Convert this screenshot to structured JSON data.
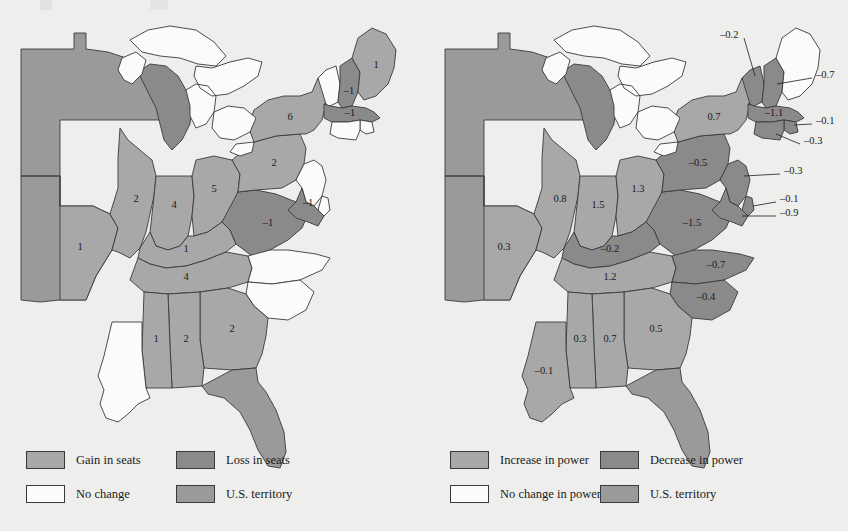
{
  "figure": {
    "background_color": "#eeeeec",
    "panels": [
      {
        "id": "seats",
        "legend": {
          "items": [
            {
              "key": "gain",
              "label": "Gain in seats",
              "color": "#a8a8a8"
            },
            {
              "key": "loss",
              "label": "Loss in seats",
              "color": "#8a8a8a"
            },
            {
              "key": "nochange",
              "label": "No change",
              "color": "#fcfcfb"
            },
            {
              "key": "territory",
              "label": "U.S. territory",
              "color": "#9a9a9a"
            }
          ]
        }
      },
      {
        "id": "power",
        "legend": {
          "items": [
            {
              "key": "gain",
              "label": "Increase in power",
              "color": "#a8a8a8"
            },
            {
              "key": "loss",
              "label": "Decrease in power",
              "color": "#8a8a8a"
            },
            {
              "key": "nochange",
              "label": "No change in power",
              "color": "#fcfcfb"
            },
            {
              "key": "territory",
              "label": "U.S. territory",
              "color": "#9a9a9a"
            }
          ]
        }
      }
    ]
  },
  "chart_data": {
    "type": "map",
    "title": "",
    "maps": [
      {
        "name": "Gain/Loss in seats",
        "value_type": "seats",
        "legend_position": "bottom-left",
        "states": [
          {
            "state": "Maine",
            "abbr": "ME",
            "value": 1,
            "label": "1",
            "category": "gain"
          },
          {
            "state": "Vermont",
            "abbr": "VT",
            "value": 0,
            "label": "",
            "category": "nochange"
          },
          {
            "state": "New Hampshire",
            "abbr": "NH",
            "value": -1,
            "label": "-1",
            "category": "loss"
          },
          {
            "state": "Massachusetts",
            "abbr": "MA",
            "value": -1,
            "label": "-1",
            "category": "loss"
          },
          {
            "state": "Rhode Island",
            "abbr": "RI",
            "value": 0,
            "label": "",
            "category": "nochange"
          },
          {
            "state": "Connecticut",
            "abbr": "CT",
            "value": 0,
            "label": "",
            "category": "nochange"
          },
          {
            "state": "New York",
            "abbr": "NY",
            "value": 6,
            "label": "6",
            "category": "gain"
          },
          {
            "state": "New Jersey",
            "abbr": "NJ",
            "value": 0,
            "label": "",
            "category": "nochange"
          },
          {
            "state": "Pennsylvania",
            "abbr": "PA",
            "value": 2,
            "label": "2",
            "category": "gain"
          },
          {
            "state": "Delaware",
            "abbr": "DE",
            "value": 0,
            "label": "",
            "category": "nochange"
          },
          {
            "state": "Maryland",
            "abbr": "MD",
            "value": -1,
            "label": "-1",
            "category": "loss"
          },
          {
            "state": "Virginia",
            "abbr": "VA",
            "value": -1,
            "label": "-1",
            "category": "loss"
          },
          {
            "state": "North Carolina",
            "abbr": "NC",
            "value": 0,
            "label": "",
            "category": "nochange"
          },
          {
            "state": "South Carolina",
            "abbr": "SC",
            "value": 0,
            "label": "",
            "category": "nochange"
          },
          {
            "state": "Georgia",
            "abbr": "GA",
            "value": 2,
            "label": "2",
            "category": "gain"
          },
          {
            "state": "Florida",
            "abbr": "FL",
            "value": null,
            "label": "",
            "category": "territory"
          },
          {
            "state": "Alabama",
            "abbr": "AL",
            "value": 2,
            "label": "2",
            "category": "gain"
          },
          {
            "state": "Mississippi",
            "abbr": "MS",
            "value": 1,
            "label": "1",
            "category": "gain"
          },
          {
            "state": "Louisiana",
            "abbr": "LA",
            "value": 0,
            "label": "",
            "category": "nochange"
          },
          {
            "state": "Tennessee",
            "abbr": "TN",
            "value": 4,
            "label": "4",
            "category": "gain"
          },
          {
            "state": "Kentucky",
            "abbr": "KY",
            "value": 1,
            "label": "1",
            "category": "gain"
          },
          {
            "state": "Ohio",
            "abbr": "OH",
            "value": 5,
            "label": "5",
            "category": "gain"
          },
          {
            "state": "Indiana",
            "abbr": "IN",
            "value": 4,
            "label": "4",
            "category": "gain"
          },
          {
            "state": "Illinois",
            "abbr": "IL",
            "value": 2,
            "label": "2",
            "category": "gain"
          },
          {
            "state": "Missouri",
            "abbr": "MO",
            "value": 1,
            "label": "1",
            "category": "gain"
          },
          {
            "state": "Michigan",
            "abbr": "MI",
            "value": null,
            "label": "",
            "category": "loss"
          },
          {
            "state": "Western territory",
            "abbr": "WT",
            "value": null,
            "label": "",
            "category": "territory"
          }
        ]
      },
      {
        "name": "Increase/Decrease in power",
        "value_type": "power",
        "legend_position": "bottom-left",
        "states": [
          {
            "state": "Maine",
            "abbr": "ME",
            "value": 0,
            "label": "",
            "category": "nochange"
          },
          {
            "state": "Vermont",
            "abbr": "VT",
            "value": -0.2,
            "label": "-0.2",
            "category": "loss",
            "leader": true
          },
          {
            "state": "New Hampshire",
            "abbr": "NH",
            "value": -0.7,
            "label": "-0.7",
            "category": "loss",
            "leader": true
          },
          {
            "state": "Massachusetts",
            "abbr": "MA",
            "value": -1.1,
            "label": "-1.1",
            "category": "loss"
          },
          {
            "state": "Rhode Island",
            "abbr": "RI",
            "value": -0.1,
            "label": "-0.1",
            "category": "loss",
            "leader": true
          },
          {
            "state": "Connecticut",
            "abbr": "CT",
            "value": -0.3,
            "label": "-0.3",
            "category": "loss",
            "leader": true
          },
          {
            "state": "New York",
            "abbr": "NY",
            "value": 0.7,
            "label": "0.7",
            "category": "gain"
          },
          {
            "state": "New Jersey",
            "abbr": "NJ",
            "value": -0.3,
            "label": "-0.3",
            "category": "loss",
            "leader": true
          },
          {
            "state": "Pennsylvania",
            "abbr": "PA",
            "value": -0.5,
            "label": "-0.5",
            "category": "loss"
          },
          {
            "state": "Delaware",
            "abbr": "DE",
            "value": -0.1,
            "label": "-0.1",
            "category": "loss",
            "leader": true
          },
          {
            "state": "Maryland",
            "abbr": "MD",
            "value": -0.9,
            "label": "-0.9",
            "category": "loss",
            "leader": true
          },
          {
            "state": "Virginia",
            "abbr": "VA",
            "value": -1.5,
            "label": "-1.5",
            "category": "loss"
          },
          {
            "state": "North Carolina",
            "abbr": "NC",
            "value": -0.7,
            "label": "-0.7",
            "category": "loss"
          },
          {
            "state": "South Carolina",
            "abbr": "SC",
            "value": -0.4,
            "label": "-0.4",
            "category": "loss"
          },
          {
            "state": "Georgia",
            "abbr": "GA",
            "value": 0.5,
            "label": "0.5",
            "category": "gain"
          },
          {
            "state": "Florida",
            "abbr": "FL",
            "value": null,
            "label": "",
            "category": "territory"
          },
          {
            "state": "Alabama",
            "abbr": "AL",
            "value": 0.7,
            "label": "0.7",
            "category": "gain"
          },
          {
            "state": "Mississippi",
            "abbr": "MS",
            "value": 0.3,
            "label": "0.3",
            "category": "gain"
          },
          {
            "state": "Louisiana",
            "abbr": "LA",
            "value": -0.1,
            "label": "-0.1",
            "category": "gain"
          },
          {
            "state": "Tennessee",
            "abbr": "TN",
            "value": 1.2,
            "label": "1.2",
            "category": "gain"
          },
          {
            "state": "Kentucky",
            "abbr": "KY",
            "value": -0.2,
            "label": "-0.2",
            "category": "loss"
          },
          {
            "state": "Ohio",
            "abbr": "OH",
            "value": 1.3,
            "label": "1.3",
            "category": "gain"
          },
          {
            "state": "Indiana",
            "abbr": "IN",
            "value": 1.5,
            "label": "1.5",
            "category": "gain"
          },
          {
            "state": "Illinois",
            "abbr": "IL",
            "value": 0.8,
            "label": "0.8",
            "category": "gain"
          },
          {
            "state": "Missouri",
            "abbr": "MO",
            "value": 0.3,
            "label": "0.3",
            "category": "gain"
          },
          {
            "state": "Michigan",
            "abbr": "MI",
            "value": null,
            "label": "",
            "category": "loss"
          },
          {
            "state": "Western territory",
            "abbr": "WT",
            "value": null,
            "label": "",
            "category": "territory"
          }
        ]
      }
    ]
  }
}
